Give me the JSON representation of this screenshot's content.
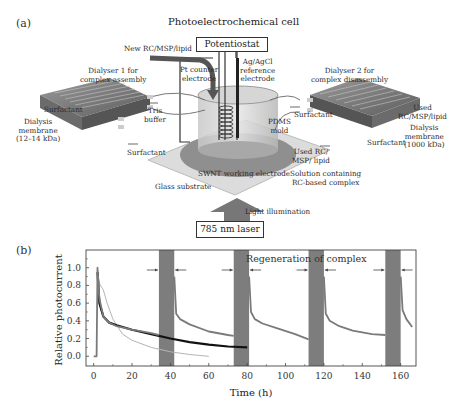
{
  "panel_a": {
    "letter": "(a)",
    "title": "Photoelectrochemical cell",
    "potentiostat": "Potentiostat",
    "new_input": "New RC/MSP/lipid",
    "pt_electrode": [
      "Pt counter",
      "electrode"
    ],
    "ref_electrode": [
      "Ag/AgCl",
      "reference",
      "electrode"
    ],
    "dialyser1": [
      "Dialyser 1 for",
      "complex assembly"
    ],
    "dialyser2": [
      "Dialyser 2 for",
      "complex disassembly"
    ],
    "surfactant": "Surfactant",
    "tris_buffer": [
      "Tris",
      "buffer"
    ],
    "membrane1": [
      "Dialysis",
      "membrane",
      "(12–14 kDa)"
    ],
    "membrane2": [
      "Dialysis",
      "membrane",
      "(1000 kDa)"
    ],
    "used_out": [
      "Used",
      "RC/MSP/lipid"
    ],
    "pdms": [
      "PDMS",
      "mold"
    ],
    "used_rc": [
      "Used RC/",
      "MSP/ lipid"
    ],
    "solution": [
      "Solution containing",
      "RC-based complex"
    ],
    "swnt": "SWNT working electrode",
    "glass": "Glass substrate",
    "light": "Light illumination",
    "laser": "785 nm laser"
  },
  "panel_b": {
    "letter": "(b)"
  },
  "chart_data": {
    "type": "line",
    "title": "",
    "annotation": "Regeneration of complex",
    "xlabel": "Time (h)",
    "ylabel": "Relative photocurrent",
    "xlim": [
      -4,
      168
    ],
    "ylim": [
      -0.11,
      1.2
    ],
    "xticks": [
      0,
      20,
      40,
      60,
      80,
      100,
      120,
      140,
      160
    ],
    "yticks": [
      "0.0",
      "0.2",
      "0.4",
      "0.6",
      "0.8",
      "1.0"
    ],
    "grid": false,
    "regeneration_bands_h": [
      [
        34,
        42
      ],
      [
        73,
        81
      ],
      [
        112,
        120
      ],
      [
        152,
        160
      ]
    ],
    "series": [
      {
        "name": "regenerated (mid gray)",
        "color": "#7a7a7a",
        "segments": [
          {
            "x": [
              0,
              1.5,
              2,
              3,
              5,
              8,
              12,
              20,
              30,
              34
            ],
            "y": [
              0.0,
              0.0,
              1.0,
              0.65,
              0.45,
              0.38,
              0.34,
              0.3,
              0.26,
              0.24
            ]
          },
          {
            "x": [
              42,
              43,
              45,
              50,
              60,
              70,
              73
            ],
            "y": [
              0.9,
              0.48,
              0.42,
              0.36,
              0.28,
              0.24,
              0.23
            ]
          },
          {
            "x": [
              81,
              82,
              84,
              88,
              95,
              105,
              112
            ],
            "y": [
              0.9,
              0.5,
              0.42,
              0.37,
              0.32,
              0.25,
              0.19
            ]
          },
          {
            "x": [
              120,
              121,
              123,
              128,
              135,
              145,
              152
            ],
            "y": [
              0.9,
              0.48,
              0.4,
              0.34,
              0.29,
              0.25,
              0.24
            ]
          },
          {
            "x": [
              160,
              161,
              163,
              166
            ],
            "y": [
              0.9,
              0.52,
              0.42,
              0.33
            ]
          }
        ]
      },
      {
        "name": "control (black)",
        "color": "#111111",
        "segments": [
          {
            "x": [
              2,
              3,
              5,
              8,
              12,
              20,
              30,
              40,
              50,
              60,
              70,
              80
            ],
            "y": [
              0.95,
              0.6,
              0.45,
              0.38,
              0.35,
              0.3,
              0.25,
              0.2,
              0.16,
              0.13,
              0.11,
              0.1
            ]
          }
        ]
      },
      {
        "name": "control (light gray)",
        "color": "#b5b5b5",
        "segments": [
          {
            "x": [
              2,
              3,
              5,
              7,
              10,
              15,
              20,
              30,
              40,
              50,
              60
            ],
            "y": [
              0.95,
              0.82,
              0.75,
              0.6,
              0.42,
              0.25,
              0.18,
              0.1,
              0.05,
              0.02,
              0.0
            ]
          }
        ]
      }
    ]
  }
}
